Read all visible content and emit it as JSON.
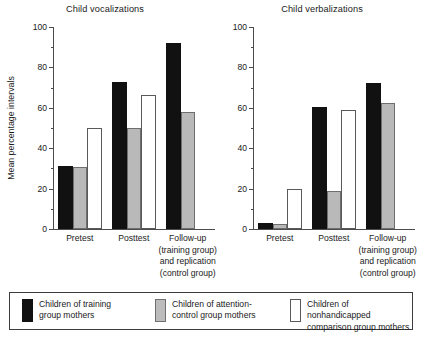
{
  "figure": {
    "ylabel": "Mean percentage intervals",
    "y_ticks_major": [
      "0",
      "20",
      "40",
      "60",
      "80",
      "100"
    ],
    "categories": [
      "Pretest",
      "Posttest",
      "Follow-up\n(training group)\nand replication\n(control group)"
    ],
    "category_labels": [
      "Pretest",
      "Posttest",
      "Follow-up (training group) and replication (control group)"
    ]
  },
  "legend": {
    "items": [
      {
        "key": "black",
        "color": "#111111",
        "label": "Children of training\ngroup mothers"
      },
      {
        "key": "gray",
        "color": "#bcbcbc",
        "label": "Children of attention-\ncontrol group mothers"
      },
      {
        "key": "white",
        "color": "#ffffff",
        "label": "Children of nonhandicapped\ncomparison group mothers"
      }
    ]
  },
  "chart_data": [
    {
      "type": "bar",
      "title": "Child vocalizations",
      "xlabel": "",
      "ylabel": "Mean percentage intervals",
      "ylim": [
        0,
        100
      ],
      "ytick_step": 20,
      "yminor_step": 10,
      "grid": false,
      "legend_position": "bottom",
      "categories": [
        "Pretest",
        "Posttest",
        "Follow-up (training group) and replication (control group)"
      ],
      "series": [
        {
          "name": "Children of training group mothers",
          "color": "#111111",
          "values": [
            31,
            73,
            92
          ]
        },
        {
          "name": "Children of attention-control group mothers",
          "color": "#bcbcbc",
          "values": [
            30.5,
            50,
            58
          ]
        },
        {
          "name": "Children of nonhandicapped comparison group mothers",
          "color": "#ffffff",
          "values": [
            50,
            66.5,
            null
          ]
        }
      ]
    },
    {
      "type": "bar",
      "title": "Child verbalizations",
      "xlabel": "",
      "ylabel": "Mean percentage intervals",
      "ylim": [
        0,
        100
      ],
      "ytick_step": 20,
      "yminor_step": 10,
      "grid": false,
      "legend_position": "bottom",
      "categories": [
        "Pretest",
        "Posttest",
        "Follow-up (training group) and replication (control group)"
      ],
      "series": [
        {
          "name": "Children of training group mothers",
          "color": "#111111",
          "values": [
            2.8,
            60.5,
            72.5
          ]
        },
        {
          "name": "Children of attention-control group mothers",
          "color": "#bcbcbc",
          "values": [
            2.5,
            19,
            62.5
          ]
        },
        {
          "name": "Children of nonhandicapped comparison group mothers",
          "color": "#ffffff",
          "values": [
            20,
            59,
            null
          ]
        }
      ]
    }
  ]
}
